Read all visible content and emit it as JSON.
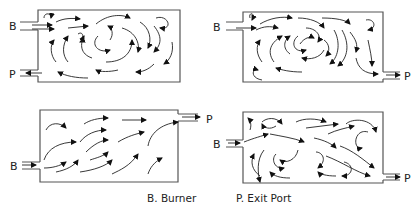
{
  "diagram": {
    "panels": [
      {
        "id": "top-left",
        "burner_label": "B",
        "exit_label": "P",
        "burner_side": "left-top",
        "exit_side": "left-bottom"
      },
      {
        "id": "top-right",
        "burner_label": "B",
        "exit_label": "P",
        "burner_side": "left-top",
        "exit_side": "right-bottom"
      },
      {
        "id": "bottom-left",
        "burner_label": "B",
        "exit_label": "P",
        "burner_side": "left-bottom",
        "exit_side": "right-top"
      },
      {
        "id": "bottom-right",
        "burner_label": "B",
        "exit_label": "P",
        "burner_side": "left-middle",
        "exit_side": "right-bottom"
      }
    ],
    "legend": {
      "burner": "B. Burner",
      "exit": "P.  Exit Port"
    }
  }
}
